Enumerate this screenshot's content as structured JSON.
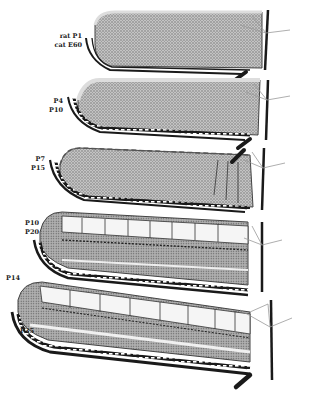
{
  "figure": {
    "panels": [
      {
        "id": "stage-1",
        "label_top": "rat  P1",
        "label_bottom": "cat  E60"
      },
      {
        "id": "stage-2",
        "label_top": "P4",
        "label_bottom": "P10"
      },
      {
        "id": "stage-3",
        "label_top": "P7",
        "label_bottom": "P15"
      },
      {
        "id": "stage-4",
        "label_top": "P10",
        "label_bottom": "P20"
      },
      {
        "id": "stage-5",
        "label_top": "P14",
        "label_bottom": "P35"
      }
    ],
    "colors": {
      "ink": "#1a1a1a",
      "tissue_fill": "#b9b9b9",
      "background": "#ffffff"
    }
  }
}
